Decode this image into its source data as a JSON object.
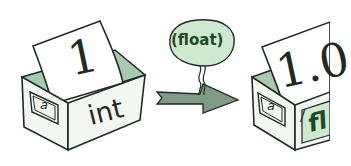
{
  "colors": {
    "outline": "#1f2a22",
    "box_face": "#f3f7f1",
    "box_inner": "#a9c9ae",
    "bubble_fill": "#cfe8d0",
    "bubble_text": "#1f4a2a",
    "arrow_fill": "#7f9a85",
    "paper": "#ffffff"
  },
  "left_box": {
    "value": "1",
    "variable_label": "a",
    "type_label": "int"
  },
  "cast_bubble": {
    "text": "(float)"
  },
  "right_box": {
    "value": "1.0",
    "variable_label": "a",
    "type_label": "fl",
    "crossed_type": "/"
  }
}
